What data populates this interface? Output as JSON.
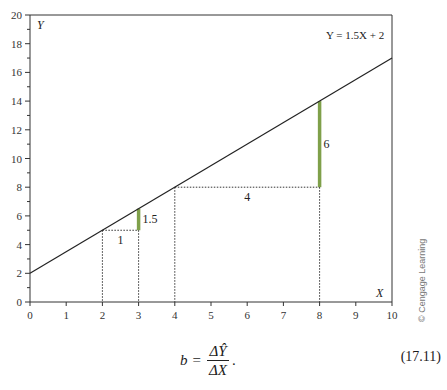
{
  "chart_data": {
    "type": "line",
    "title": "",
    "equation_label": "Y = 1.5X + 2",
    "xlabel": "X",
    "ylabel": "Y",
    "xlim": [
      0,
      10
    ],
    "ylim": [
      0,
      20
    ],
    "x_ticks": [
      "0",
      "1",
      "2",
      "3",
      "4",
      "5",
      "6",
      "7",
      "8",
      "9",
      "10"
    ],
    "y_ticks": [
      "0",
      "2",
      "4",
      "6",
      "8",
      "10",
      "12",
      "14",
      "16",
      "18",
      "20"
    ],
    "grid": false,
    "legend": null,
    "series": [
      {
        "name": "Y = 1.5X + 2",
        "x": [
          0,
          10
        ],
        "y": [
          2,
          17
        ]
      }
    ],
    "annotations": [
      {
        "type": "run",
        "from": [
          2,
          5
        ],
        "to": [
          3,
          5
        ],
        "label": "1"
      },
      {
        "type": "rise",
        "from": [
          3,
          5
        ],
        "to": [
          3,
          6.5
        ],
        "label": "1.5",
        "color": "#7fa04a"
      },
      {
        "type": "run",
        "from": [
          4,
          8
        ],
        "to": [
          8,
          8
        ],
        "label": "4"
      },
      {
        "type": "rise",
        "from": [
          8,
          8
        ],
        "to": [
          8,
          14
        ],
        "label": "6",
        "color": "#7fa04a"
      },
      {
        "type": "drop",
        "x": 2,
        "y": 5
      },
      {
        "type": "drop",
        "x": 3,
        "y": 5
      },
      {
        "type": "drop",
        "x": 4,
        "y": 8
      },
      {
        "type": "drop",
        "x": 8,
        "y": 8
      }
    ]
  },
  "credit": "© Cengage Learning",
  "formula": {
    "lhs": "b",
    "equals": "=",
    "numerator": "ΔŶ",
    "denominator": "ΔX",
    "trailing": ".",
    "number": "(17.11)"
  }
}
